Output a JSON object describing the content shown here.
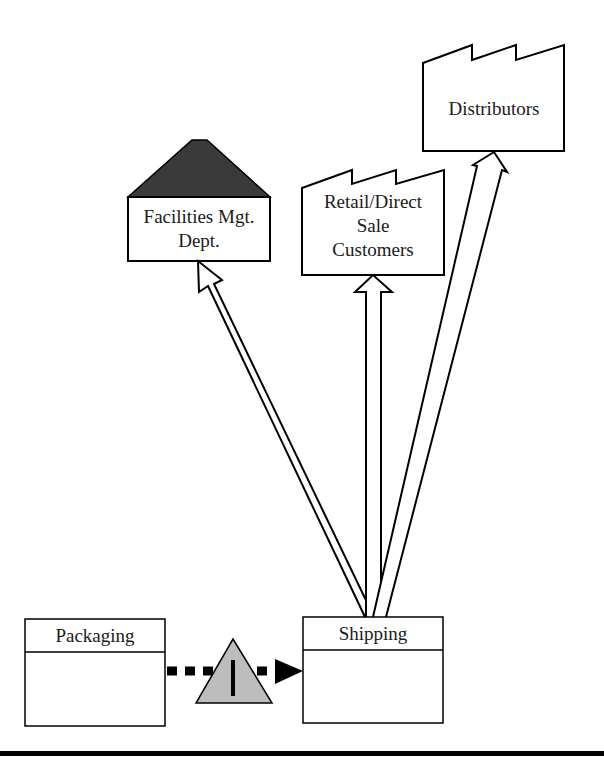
{
  "diagram": {
    "type": "value-stream-map",
    "nodes": {
      "distributors": {
        "label": "Distributors",
        "shape": "factory"
      },
      "facilities": {
        "label": "Facilities Mgt.\nDept.",
        "shape": "house"
      },
      "retail": {
        "label": "Retail/Direct\nSale\nCustomers",
        "shape": "factory"
      },
      "packaging": {
        "label": "Packaging",
        "shape": "process-box"
      },
      "shipping": {
        "label": "Shipping",
        "shape": "process-box"
      },
      "inventory": {
        "label": "I",
        "shape": "inventory-triangle"
      }
    },
    "edges": [
      {
        "from": "shipping",
        "to": "facilities",
        "style": "shipment-arrow"
      },
      {
        "from": "shipping",
        "to": "retail",
        "style": "shipment-arrow"
      },
      {
        "from": "shipping",
        "to": "distributors",
        "style": "shipment-arrow"
      },
      {
        "from": "packaging",
        "to": "shipping",
        "style": "push-arrow",
        "via": "inventory"
      }
    ],
    "colors": {
      "stroke": "#000000",
      "roof_fill": "#3a3a3a",
      "inventory_fill": "#bdbdbd",
      "background": "#ffffff"
    }
  }
}
